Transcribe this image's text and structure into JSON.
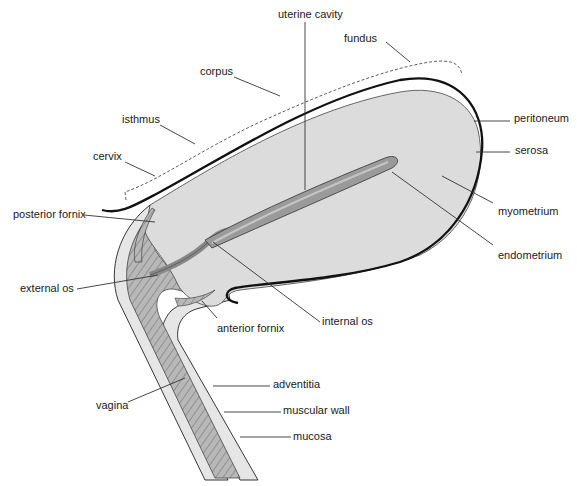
{
  "diagram": {
    "colors": {
      "background": "#ffffff",
      "myometrium_fill": "#dcdcdc",
      "endometrium_fill": "#9a9a9a",
      "cavity_fill": "#c4c4c4",
      "muscular_fill": "#b8b8b8",
      "adventitia_fill": "#e6e6e6",
      "outline": "#111111"
    },
    "labels": {
      "uterine_cavity": "uterine cavity",
      "fundus": "fundus",
      "corpus": "corpus",
      "isthmus": "isthmus",
      "cervix": "cervix",
      "peritoneum": "peritoneum",
      "serosa": "serosa",
      "posterior_fornix": "posterior fornix",
      "myometrium": "myometrium",
      "endometrium": "endometrium",
      "external_os": "external os",
      "internal_os": "internal os",
      "anterior_fornix": "anterior fornix",
      "vagina": "vagina",
      "adventitia": "adventitia",
      "muscular_wall": "muscular wall",
      "mucosa": "mucosa"
    }
  }
}
